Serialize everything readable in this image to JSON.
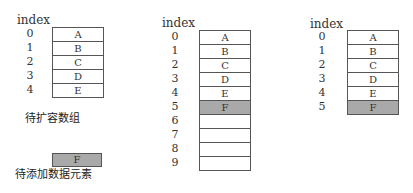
{
  "left": {
    "index_header": "index",
    "indices": [
      "0",
      "1",
      "2",
      "3",
      "4"
    ],
    "cells": [
      "A",
      "B",
      "C",
      "D",
      "E"
    ],
    "caption": "待扩容数组",
    "new_element": "F",
    "new_element_caption": "待添加数据元素"
  },
  "middle": {
    "index_header": "index",
    "indices": [
      "0",
      "1",
      "2",
      "3",
      "4",
      "5",
      "6",
      "7",
      "8",
      "9"
    ],
    "cells": [
      "A",
      "B",
      "C",
      "D",
      "E",
      "F",
      "",
      "",
      "",
      ""
    ],
    "highlighted_index": 5
  },
  "right": {
    "index_header": "index",
    "indices": [
      "0",
      "1",
      "2",
      "3",
      "4",
      "5"
    ],
    "cells": [
      "A",
      "B",
      "C",
      "D",
      "E",
      "F"
    ],
    "highlighted_index": 5
  },
  "colors": {
    "highlight": "#a9a9a9",
    "border": "#555555"
  }
}
